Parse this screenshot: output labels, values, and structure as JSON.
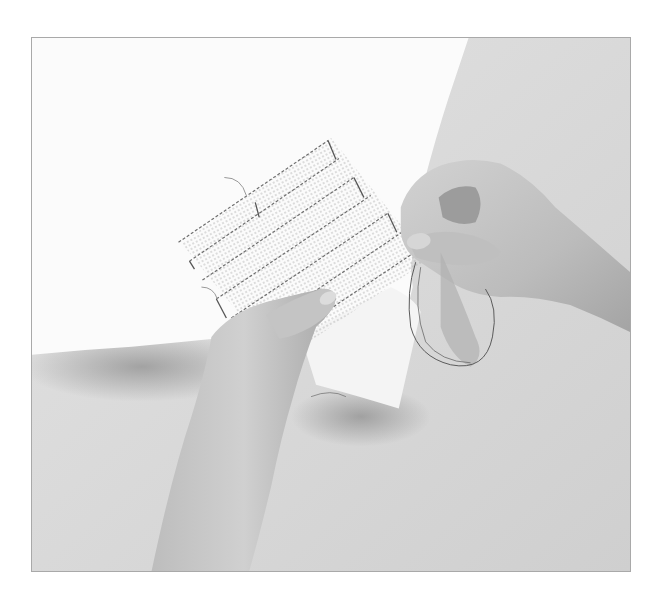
{
  "photo": {
    "subject": "hands basting waste canvas onto fabric with needle and thread",
    "style": "grayscale",
    "colors": {
      "page_background": "#ffffff",
      "frame_border": "#a9a9a9",
      "tabletop": "#d6d6d6",
      "fabric": "#fbfbfb",
      "skin_light": "#c9c9c9",
      "skin_mid": "#b3b3b3",
      "skin_shadow": "#8f8f8f",
      "stitch_line": "#6e6e6e",
      "thread": "#5a5a5a"
    }
  }
}
